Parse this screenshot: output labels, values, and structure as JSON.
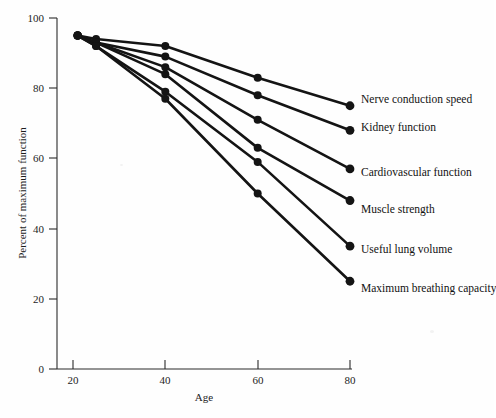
{
  "chart_data": {
    "type": "line",
    "title": "",
    "xlabel": "Age",
    "ylabel": "Percent of maximum function",
    "xlim": [
      15,
      80
    ],
    "ylim": [
      0,
      100
    ],
    "x_ticks": [
      20,
      40,
      60,
      80
    ],
    "y_ticks": [
      0,
      20,
      40,
      60,
      80,
      100
    ],
    "grid": false,
    "legend_position": "right-of-line-ends",
    "x": [
      21,
      25,
      40,
      60,
      80
    ],
    "series": [
      {
        "name": "Nerve conduction speed",
        "values": [
          95,
          94,
          92,
          83,
          75
        ],
        "color": "#141414"
      },
      {
        "name": "Kidney function",
        "values": [
          95,
          93,
          89,
          78,
          68
        ],
        "color": "#141414"
      },
      {
        "name": "Cardiovascular function",
        "values": [
          95,
          93,
          86,
          71,
          57
        ],
        "color": "#141414"
      },
      {
        "name": "Muscle strength",
        "values": [
          95,
          93,
          84,
          63,
          48
        ],
        "color": "#141414"
      },
      {
        "name": "Useful lung volume",
        "values": [
          95,
          92,
          79,
          59,
          35
        ],
        "color": "#141414"
      },
      {
        "name": "Maximum breathing capacity",
        "values": [
          95,
          92,
          77,
          50,
          25
        ],
        "color": "#141414"
      }
    ],
    "x_tick_labels": [
      "20",
      "40",
      "60",
      "80"
    ],
    "y_tick_labels": [
      "0",
      "20",
      "40",
      "60",
      "80",
      "100"
    ]
  },
  "axes": {
    "y_label": "Percent of maximum function",
    "x_label": "Age",
    "y_tick_labels": [
      "100",
      "80",
      "60",
      "40",
      "20",
      "0"
    ],
    "x_tick_labels": [
      "20",
      "40",
      "60",
      "80"
    ]
  },
  "legend": {
    "items": [
      {
        "label": "Nerve conduction speed"
      },
      {
        "label": "Kidney function"
      },
      {
        "label": "Cardiovascular function"
      },
      {
        "label": "Muscle strength"
      },
      {
        "label": "Useful lung volume"
      },
      {
        "label": "Maximum breathing capacity"
      }
    ]
  }
}
